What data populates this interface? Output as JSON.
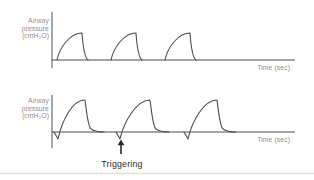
{
  "colors": {
    "background": "#ffffff",
    "trace": "#4d4d4d",
    "axis": "#4d4d4d",
    "label": "#8f8f8f",
    "annotation": "#2b2b2b",
    "divider": "#e0e0e0"
  },
  "panels": [
    {
      "id": "machine-cycled-breaths",
      "ylabel_lines": [
        "Airway",
        "pressure",
        "(cmH₂O)"
      ],
      "xlabel": "Time (sec)",
      "axis_path": "M52 12 V68 M52 60 H295",
      "waves": [
        {
          "path": "M57 60 C60 46, 71 33, 82 33 C83 47, 85 58, 88 60"
        },
        {
          "path": "M111 60 C114 46, 125 33, 136 33 C137 47, 139 58, 142 60"
        },
        {
          "path": "M165 60 C168 46, 179 33, 190 33 C191 47, 193 58, 196 60"
        }
      ]
    },
    {
      "id": "patient-triggered-breaths",
      "ylabel_lines": [
        "Airway",
        "pressure",
        "(cmH₂O)"
      ],
      "xlabel": "Time (sec)",
      "axis_path": "M52 95 V148 M52 132 H295",
      "waves": [
        {
          "path": "M54 132 L58 139 C62 121, 72 100, 85 100 C87 115, 88 127, 91 129 Q95 132, 104 132"
        },
        {
          "path": "M116 132 L120 139 C124 121, 137 100, 150 100 C152 115, 153 127, 156 129 Q160 132, 169 132"
        },
        {
          "path": "M184 132 L188 139 C192 121, 204 100, 217 100 C219 115, 220 127, 223 129 Q227 132, 236 132"
        }
      ]
    }
  ],
  "annotation": {
    "label": "Triggering",
    "arrow_shaft_path": "M121 154 V144.5",
    "arrow_head_path": "M121 139.5 L117.6 145.3 L124.4 145.3 Z"
  },
  "divider_path": "M0 173.5 H314"
}
